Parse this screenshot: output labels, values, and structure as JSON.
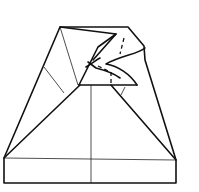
{
  "diagram": {
    "type": "origami-fold-diagram",
    "colors": {
      "line": "#111111",
      "background": "#ffffff"
    }
  }
}
